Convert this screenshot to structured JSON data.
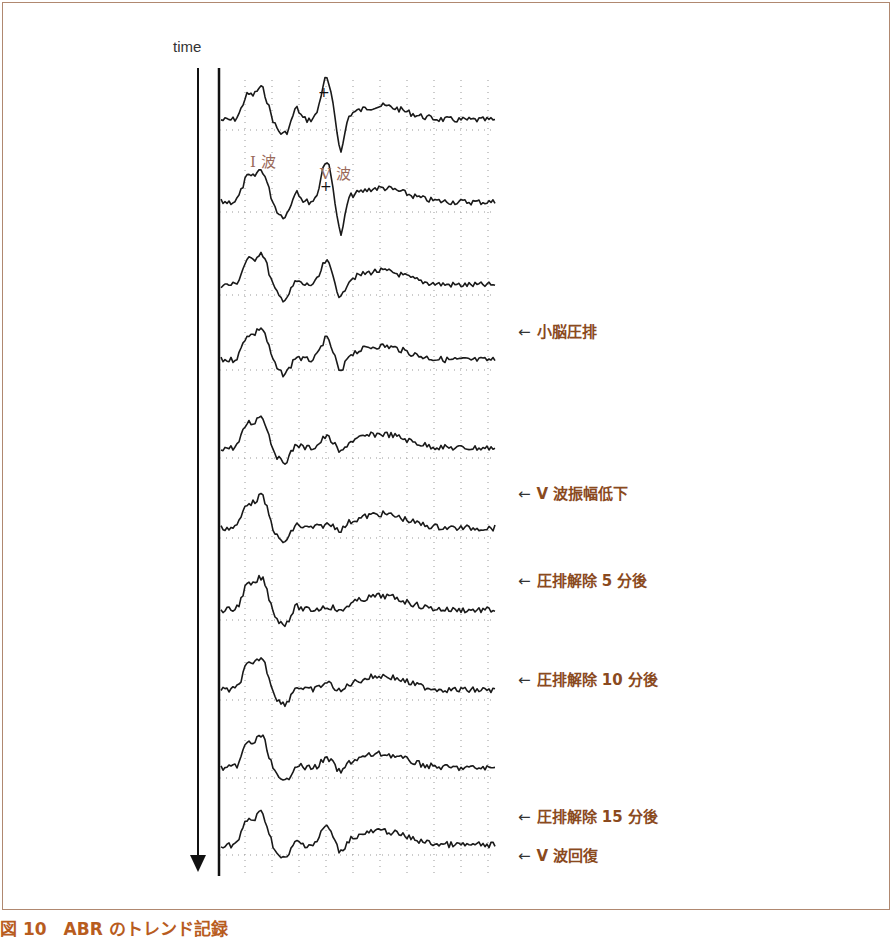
{
  "caption": "図 10　ABR のトレンド記録",
  "chart_data": {
    "type": "line",
    "title": "ABR のトレンド記録",
    "ylabel": "time",
    "x_description": "latency (ms), traces stacked vertically over time",
    "grid": true,
    "wave_labels": [
      "I 波",
      "V 波"
    ],
    "traces": [
      {
        "index": 1,
        "annotation": "",
        "wave_I_peak": "high",
        "wave_V_peak": "high"
      },
      {
        "index": 2,
        "annotation": "",
        "wave_I_peak": "high",
        "wave_V_peak": "high"
      },
      {
        "index": 3,
        "annotation": "小脳圧排",
        "wave_I_peak": "high",
        "wave_V_peak": "medium"
      },
      {
        "index": 4,
        "annotation": "",
        "wave_I_peak": "high",
        "wave_V_peak": "medium"
      },
      {
        "index": 5,
        "annotation": "V 波振幅低下",
        "wave_I_peak": "high",
        "wave_V_peak": "low"
      },
      {
        "index": 6,
        "annotation": "圧排解除 5 分後",
        "wave_I_peak": "high",
        "wave_V_peak": "absent"
      },
      {
        "index": 7,
        "annotation": "",
        "wave_I_peak": "high",
        "wave_V_peak": "absent"
      },
      {
        "index": 8,
        "annotation": "圧排解除 10 分後",
        "wave_I_peak": "high",
        "wave_V_peak": "low"
      },
      {
        "index": 9,
        "annotation": "",
        "wave_I_peak": "high",
        "wave_V_peak": "low"
      },
      {
        "index": 10,
        "annotation": "圧排解除 15 分後 / V 波回復",
        "wave_I_peak": "high",
        "wave_V_peak": "medium"
      }
    ]
  },
  "axis": {
    "time_label": "time"
  },
  "wave_labels": {
    "wave1": "I 波",
    "wave5": "V 波"
  },
  "annotations": [
    {
      "label": "小脳圧排",
      "top": 320
    },
    {
      "label": "V 波振幅低下",
      "top": 482
    },
    {
      "label": "圧排解除 5 分後",
      "top": 569
    },
    {
      "label": "圧排解除 10 分後",
      "top": 668
    },
    {
      "label": "圧排解除 15 分後",
      "top": 805
    },
    {
      "label": "V 波回復",
      "top": 844
    }
  ],
  "arrow": "←",
  "colors": {
    "annotation": "#8a4a1e",
    "caption": "#b85c1e",
    "frame": "#b08870",
    "trace": "#222222"
  }
}
